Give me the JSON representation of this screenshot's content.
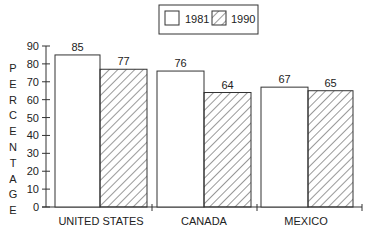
{
  "chart_data": {
    "type": "bar",
    "title": "",
    "xlabel": "",
    "ylabel": "PERCENTAGE",
    "ylim": [
      0,
      90
    ],
    "yticks": [
      0,
      10,
      20,
      30,
      40,
      50,
      60,
      70,
      80,
      90
    ],
    "grid": false,
    "legend_position": "top-center",
    "categories": [
      "UNITED STATES",
      "CANADA",
      "MEXICO"
    ],
    "series": [
      {
        "name": "1981",
        "style": "white",
        "values": [
          85,
          76,
          67
        ]
      },
      {
        "name": "1990",
        "style": "hatched",
        "values": [
          77,
          64,
          65
        ]
      }
    ]
  },
  "colors": {
    "stroke": "#333333",
    "fill_1981": "#ffffff",
    "hatch_1990": "#333333",
    "background": "#ffffff"
  }
}
